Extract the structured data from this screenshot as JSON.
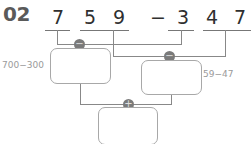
{
  "problem": {
    "number": "02",
    "expression": {
      "digits": [
        "7",
        "5",
        "9",
        "−",
        "3",
        "4",
        "7"
      ]
    },
    "operators": {
      "first": "−",
      "second": "−",
      "combine": "+"
    },
    "hints": {
      "left": "700−300",
      "right": "59−47"
    },
    "boxes": {
      "left": "",
      "right": "",
      "result": ""
    }
  }
}
